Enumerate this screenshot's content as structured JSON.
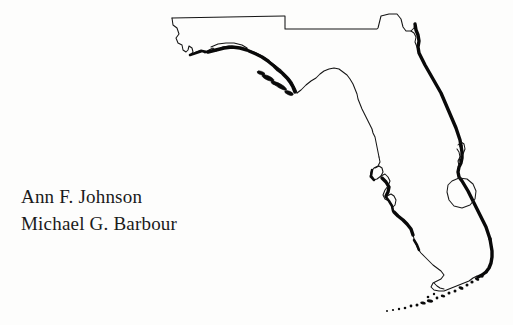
{
  "page": {
    "background_color": "#fdfdfc",
    "ink_color": "#141414",
    "width": 513,
    "height": 325
  },
  "authors": {
    "line1": "Ann F. Johnson",
    "line2": "Michael G. Barbour"
  },
  "figure": {
    "name": "florida-state-outline-map",
    "features": [
      {
        "name": "northern-state-border",
        "style": "thin"
      },
      {
        "name": "panhandle-gulf-barrier-islands",
        "style": "bold"
      },
      {
        "name": "big-bend-coast",
        "style": "thin"
      },
      {
        "name": "southwest-gulf-barrier-islands",
        "style": "bold"
      },
      {
        "name": "atlantic-coast",
        "style": "bold"
      },
      {
        "name": "lake-okeechobee",
        "style": "thin"
      },
      {
        "name": "everglades-florida-bay-coast",
        "style": "thin"
      },
      {
        "name": "florida-keys",
        "style": "dotted"
      }
    ]
  }
}
